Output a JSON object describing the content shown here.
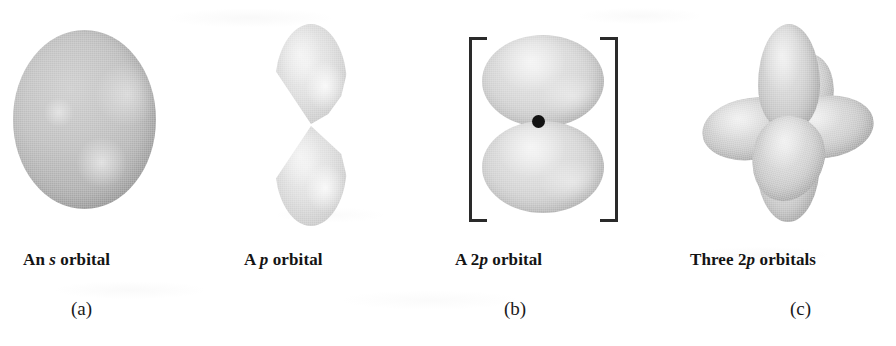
{
  "figure": {
    "kind": "atomic-orbital-illustration",
    "background_color": "#ffffff",
    "orbital_fill_color": "#c8c8c8",
    "nucleus_color": "#121212",
    "bracket_color": "#2a2a2a"
  },
  "panels": [
    {
      "id": "a-left",
      "shape": "sphere",
      "caption_prefix": "An ",
      "caption_italic": "s",
      "caption_suffix": " orbital",
      "caption_plain": "An s orbital",
      "sublabel": "(a)",
      "has_nucleus_dot": false,
      "has_brackets": false
    },
    {
      "id": "a-right",
      "shape": "dumbbell",
      "caption_prefix": "A ",
      "caption_italic": "p",
      "caption_suffix": " orbital",
      "caption_plain": "A p orbital",
      "sublabel": "(a)",
      "has_nucleus_dot": false,
      "has_brackets": false
    },
    {
      "id": "b",
      "shape": "two-lobes-with-nucleus",
      "caption_prefix": "A 2",
      "caption_italic": "p",
      "caption_suffix": " orbital",
      "caption_plain": "A 2p orbital",
      "sublabel": "(b)",
      "has_nucleus_dot": true,
      "has_brackets": true
    },
    {
      "id": "c",
      "shape": "six-lobe-cluster",
      "caption_prefix": "Three 2",
      "caption_italic": "p",
      "caption_suffix": " orbitals",
      "caption_plain": "Three 2p orbitals",
      "sublabel": "(c)",
      "has_nucleus_dot": false,
      "has_brackets": false
    }
  ],
  "sublabels": {
    "a": "(a)",
    "b": "(b)",
    "c": "(c)"
  }
}
